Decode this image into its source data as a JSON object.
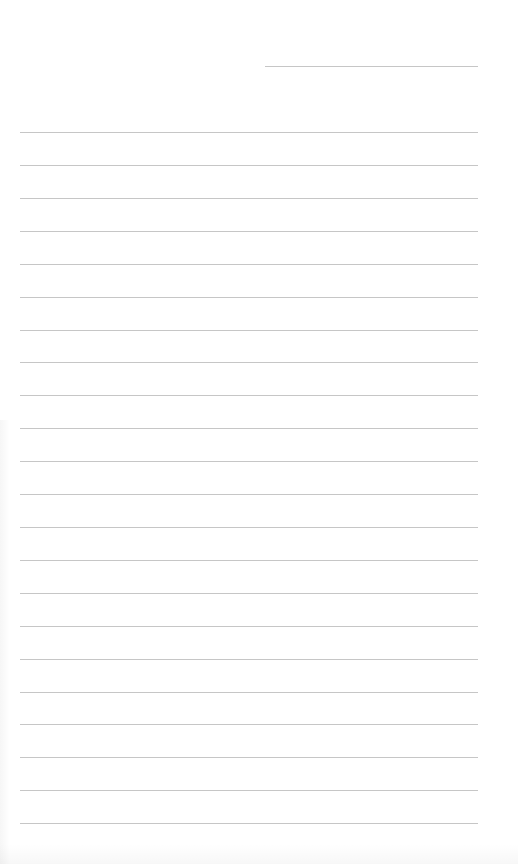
{
  "document": {
    "type": "lined-paper",
    "background_color": "#ffffff",
    "line_color": "#c6c6c6",
    "header_line": {
      "x": 265,
      "y": 66,
      "width": 213
    },
    "rules": {
      "count": 22,
      "x": 20,
      "width": 458,
      "y_positions": [
        132,
        165,
        198,
        231,
        264,
        297,
        330,
        362,
        395,
        428,
        461,
        494,
        527,
        560,
        593,
        626,
        659,
        692,
        724,
        757,
        790,
        823
      ]
    }
  }
}
